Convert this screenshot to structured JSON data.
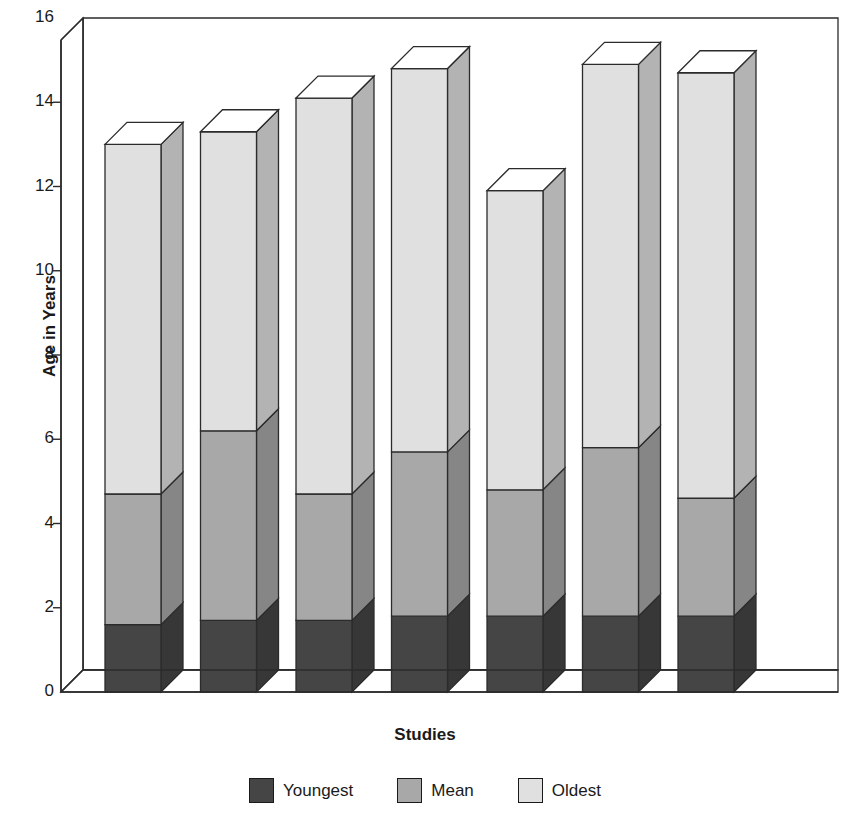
{
  "chart_data": {
    "type": "bar",
    "subtype": "stacked-3d-column",
    "title": "",
    "xlabel": "Studies",
    "ylabel": "Age in Years",
    "ylim": [
      0,
      16
    ],
    "ytick_values": [
      0,
      2,
      4,
      6,
      8,
      10,
      12,
      14,
      16
    ],
    "ytick_labels": [
      "0",
      "2",
      "4",
      "6",
      "8",
      "10",
      "12",
      "14",
      "16"
    ],
    "grid": false,
    "legend_position": "bottom",
    "categories": [
      "1",
      "2",
      "3",
      "4",
      "5",
      "6",
      "7"
    ],
    "category_labels_visible": false,
    "series": [
      {
        "name": "Youngest",
        "color": "#454545",
        "values": [
          1.6,
          1.7,
          1.7,
          1.8,
          1.8,
          1.8,
          1.8
        ]
      },
      {
        "name": "Mean",
        "color": "#a8a8a8",
        "values": [
          4.7,
          6.2,
          4.7,
          5.7,
          4.8,
          5.8,
          4.6
        ]
      },
      {
        "name": "Oldest",
        "color": "#e0e0e0",
        "values": [
          13.0,
          13.3,
          14.1,
          14.8,
          11.9,
          14.9,
          14.7
        ]
      }
    ],
    "stacking_note": "Series values are cumulative top edges of each stacked segment",
    "axis_color": "#1a1a1a",
    "background": "#ffffff"
  },
  "legend": {
    "items": [
      {
        "label": "Youngest",
        "color": "#454545"
      },
      {
        "label": "Mean",
        "color": "#a8a8a8"
      },
      {
        "label": "Oldest",
        "color": "#e0e0e0"
      }
    ]
  }
}
